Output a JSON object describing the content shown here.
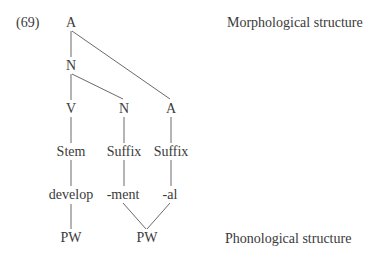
{
  "example_number": "(69)",
  "labels": {
    "morphological": "Morphological structure",
    "phonological": "Phonological structure"
  },
  "tree": {
    "root": "A",
    "n1": "N",
    "v": "V",
    "n2": "N",
    "a2": "A",
    "stem": "Stem",
    "suffix1": "Suffix",
    "suffix2": "Suffix",
    "develop": "develop",
    "ment": "-ment",
    "al": "-al",
    "pw1": "PW",
    "pw2": "PW"
  }
}
